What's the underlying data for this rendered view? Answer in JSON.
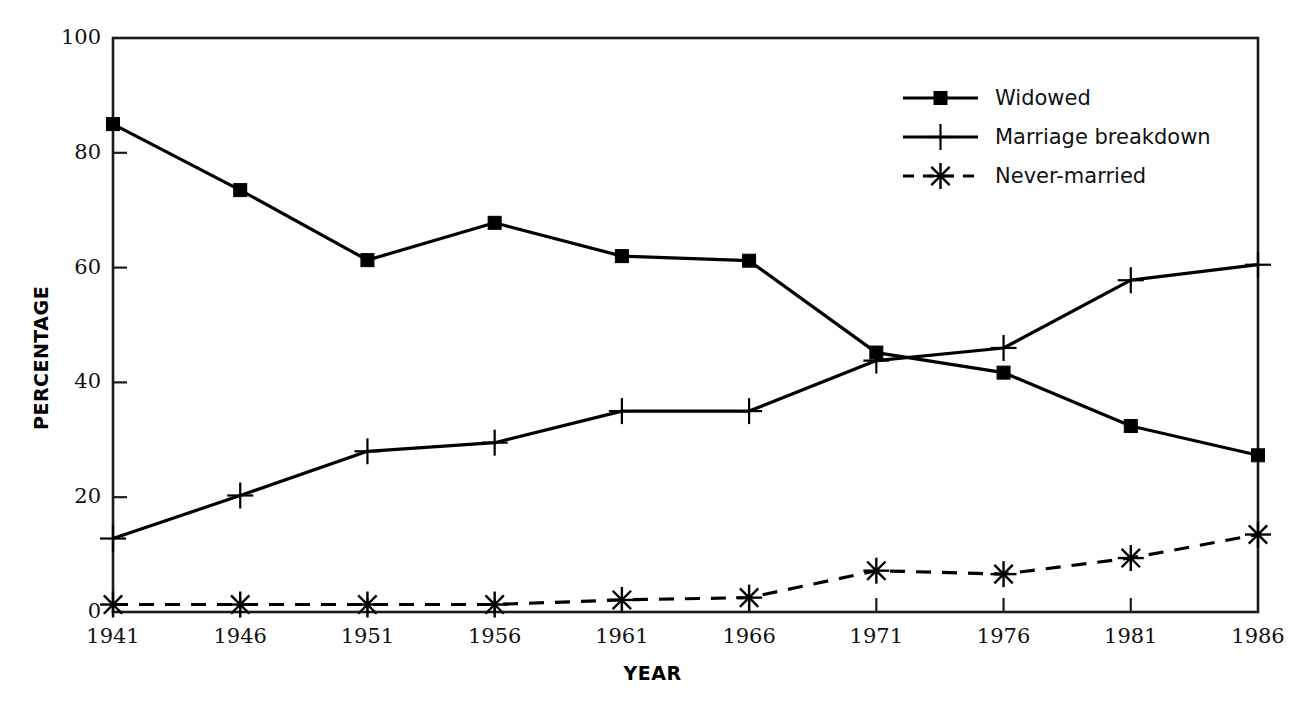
{
  "chart_data": {
    "type": "line",
    "title": "",
    "xlabel": "YEAR",
    "ylabel": "PERCENTAGE",
    "x": [
      1941,
      1946,
      1951,
      1956,
      1961,
      1966,
      1971,
      1976,
      1981,
      1986
    ],
    "categories": [
      "1941",
      "1946",
      "1951",
      "1956",
      "1961",
      "1966",
      "1971",
      "1976",
      "1981",
      "1986"
    ],
    "xlim": [
      1941,
      1986
    ],
    "ylim": [
      0,
      100
    ],
    "yticks": [
      0,
      20,
      40,
      60,
      80,
      100
    ],
    "ytick_labels": [
      "0",
      "20",
      "40",
      "60",
      "80",
      "100"
    ],
    "grid": false,
    "legend_position": "top-right",
    "series": [
      {
        "name": "Widowed",
        "marker": "square",
        "linestyle": "solid",
        "color": "#000000",
        "values": [
          85.0,
          73.5,
          61.3,
          67.8,
          62.0,
          61.2,
          45.2,
          41.7,
          32.4,
          27.3
        ]
      },
      {
        "name": "Marriage breakdown",
        "marker": "plus",
        "linestyle": "solid",
        "color": "#000000",
        "values": [
          12.8,
          20.3,
          28.0,
          29.5,
          35.0,
          35.0,
          43.8,
          46.0,
          57.8,
          60.5
        ]
      },
      {
        "name": "Never-married",
        "marker": "asterisk",
        "linestyle": "dashed",
        "color": "#000000",
        "values": [
          1.3,
          1.3,
          1.3,
          1.3,
          2.1,
          2.5,
          7.2,
          6.6,
          9.4,
          13.5
        ]
      }
    ]
  },
  "legend": {
    "entries": [
      {
        "label": "Widowed"
      },
      {
        "label": "Marriage breakdown"
      },
      {
        "label": "Never-married"
      }
    ]
  }
}
